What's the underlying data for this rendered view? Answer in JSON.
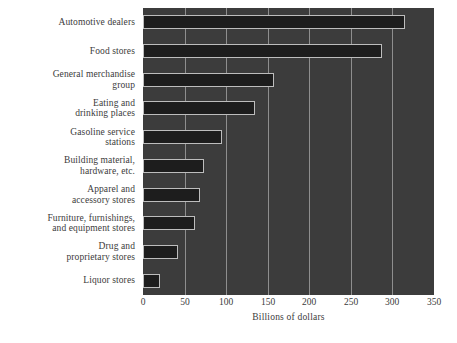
{
  "chart_data": {
    "type": "bar",
    "orientation": "horizontal",
    "title": "",
    "xlabel": "Billions of dollars",
    "ylabel": "",
    "xlim": [
      0,
      350
    ],
    "xticks": [
      0,
      50,
      100,
      150,
      200,
      250,
      300,
      350
    ],
    "xtick_labels": [
      "0",
      "50",
      "100",
      "150",
      "200",
      "250",
      "300",
      "350"
    ],
    "grid": true,
    "legend": "none",
    "categories": [
      "Automotive dealers",
      "Food stores",
      "General merchandise group",
      "Eating and drinking places",
      "Gasoline service stations",
      "Building material, hardware, etc.",
      "Apparel and accessory stores",
      "Furniture, furnishings, and equipment stores",
      "Drug and proprietary stores",
      "Liquor stores"
    ],
    "category_label_lines": [
      [
        "Automotive dealers"
      ],
      [
        "Food stores"
      ],
      [
        "General merchandise",
        "group"
      ],
      [
        "Eating and",
        "drinking places"
      ],
      [
        "Gasoline service",
        "stations"
      ],
      [
        "Building material,",
        "hardware, etc."
      ],
      [
        "Apparel and",
        "accessory stores"
      ],
      [
        "Furniture, furnishings,",
        "and equipment stores"
      ],
      [
        "Drug and",
        "proprietary stores"
      ],
      [
        "Liquor stores"
      ]
    ],
    "values": [
      315,
      288,
      158,
      135,
      95,
      73,
      68,
      63,
      42,
      20
    ]
  },
  "colors": {
    "page_background": "#ffffff",
    "plot_background": "#3c3c3c",
    "bar_fill": "#1d1d1d",
    "bar_outline": "#bdbdbd",
    "gridline": "#8e8e8e",
    "text": "#3b3b3b"
  }
}
